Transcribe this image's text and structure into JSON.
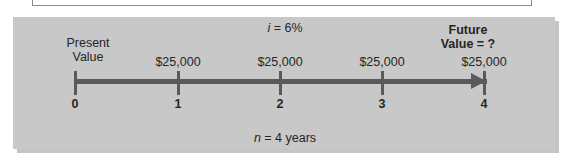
{
  "figure": {
    "interest_rate_label": {
      "variable": "i",
      "rest": " = 6%"
    },
    "period_label": {
      "variable": "n",
      "rest": " = 4 years"
    },
    "present_value_label": {
      "line1": "Present",
      "line2": "Value"
    },
    "future_value_label": {
      "line1": "Future",
      "line2": "Value = ?"
    },
    "timeline": {
      "ticks": [
        {
          "label": "0",
          "x": 75,
          "cashflow": ""
        },
        {
          "label": "1",
          "x": 178,
          "cashflow": "$25,000"
        },
        {
          "label": "2",
          "x": 280,
          "cashflow": "$25,000"
        },
        {
          "label": "3",
          "x": 382,
          "cashflow": "$25,000"
        },
        {
          "label": "4",
          "x": 484,
          "cashflow": "$25,000"
        }
      ]
    },
    "colors": {
      "panel_background": "#c8c8c8",
      "axis": "#5a5a5a",
      "text": "#262626"
    }
  }
}
